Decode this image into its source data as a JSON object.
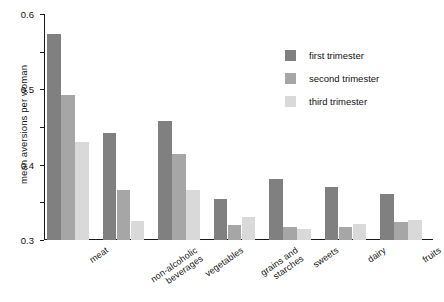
{
  "chart_data": {
    "type": "bar",
    "title": "",
    "xlabel": "",
    "ylabel": "mean aversions per woman",
    "ylim": [
      0,
      0.6
    ],
    "yticks": [
      "0",
      "0.1",
      "0.2",
      "0.3",
      "0.4",
      "0.5",
      "0.6"
    ],
    "ytick_values": [
      0,
      0.1,
      0.2,
      0.3,
      0.4,
      0.5,
      0.6
    ],
    "grid": false,
    "legend_position": "top-right",
    "categories": [
      "meat",
      "non-alcoholic\nbeverages",
      "vegetables",
      "grains and\nstarches",
      "sweets",
      "dairy",
      "fruits"
    ],
    "series": [
      {
        "name": "first trimester",
        "color": "#808080",
        "values": [
          0.548,
          0.285,
          0.315,
          0.108,
          0.162,
          0.14,
          0.122
        ]
      },
      {
        "name": "second trimester",
        "color": "#a6a6a6",
        "values": [
          0.385,
          0.133,
          0.228,
          0.04,
          0.035,
          0.035,
          0.048
        ]
      },
      {
        "name": "third trimester",
        "color": "#d9d9d9",
        "values": [
          0.26,
          0.051,
          0.133,
          0.06,
          0.028,
          0.042,
          0.053
        ]
      }
    ]
  },
  "colors": {
    "first_trimester": "#808080",
    "second_trimester": "#a6a6a6",
    "third_trimester": "#d9d9d9",
    "axis": "#1a1a1a",
    "text": "#111111",
    "background": "#ffffff"
  }
}
